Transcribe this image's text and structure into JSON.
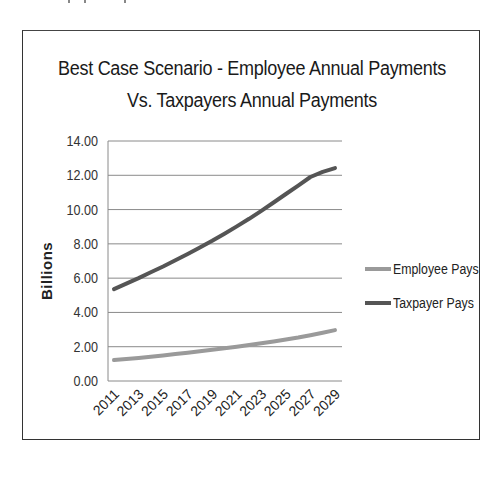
{
  "page": {
    "top_fragment": ""
  },
  "chart": {
    "title_line1": "Best Case Scenario - Employee Annual Payments",
    "title_line2": "Vs. Taxpayers Annual Payments",
    "ylabel": "Billions",
    "yticks": [
      "0.00",
      "2.00",
      "4.00",
      "6.00",
      "8.00",
      "10.00",
      "12.00",
      "14.00"
    ],
    "xticks": [
      "2011",
      "2013",
      "2015",
      "2017",
      "2019",
      "2021",
      "2023",
      "2025",
      "2027",
      "2029"
    ],
    "legend": [
      {
        "label": "Employee Pays",
        "color": "#9a9a9a"
      },
      {
        "label": "Taxpayer Pays",
        "color": "#555555"
      }
    ]
  },
  "chart_data": {
    "type": "line",
    "title": "Best Case Scenario - Employee Annual Payments Vs. Taxpayers Annual Payments",
    "xlabel": "",
    "ylabel": "Billions",
    "ylim": [
      0,
      14
    ],
    "grid": true,
    "legend_position": "right",
    "x": [
      2011,
      2012,
      2013,
      2014,
      2015,
      2016,
      2017,
      2018,
      2019,
      2020,
      2021,
      2022,
      2023,
      2024,
      2025,
      2026,
      2027,
      2028,
      2029
    ],
    "x_tick_labels": [
      "2011",
      "2013",
      "2015",
      "2017",
      "2019",
      "2021",
      "2023",
      "2025",
      "2027",
      "2029"
    ],
    "series": [
      {
        "name": "Employee Pays",
        "color": "#9a9a9a",
        "values": [
          1.22,
          1.28,
          1.35,
          1.42,
          1.49,
          1.57,
          1.65,
          1.73,
          1.82,
          1.91,
          2.0,
          2.1,
          2.2,
          2.31,
          2.42,
          2.54,
          2.67,
          2.82,
          2.97
        ]
      },
      {
        "name": "Taxpayer Pays",
        "color": "#555555",
        "values": [
          5.36,
          5.68,
          6.0,
          6.34,
          6.68,
          7.04,
          7.41,
          7.79,
          8.18,
          8.59,
          9.02,
          9.46,
          9.93,
          10.41,
          10.91,
          11.4,
          11.9,
          12.2,
          12.42
        ]
      }
    ]
  }
}
